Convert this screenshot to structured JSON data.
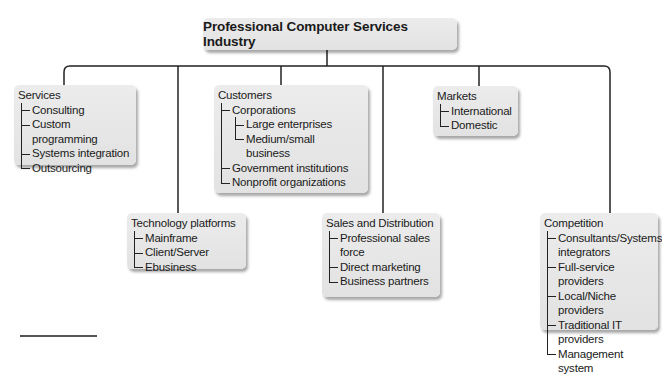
{
  "diagram": {
    "title": "Professional Computer Services Industry",
    "colors": {
      "box_fill": "#e6e6e6",
      "line": "#222222",
      "text": "#1a1a1a"
    },
    "categories": [
      {
        "id": "services",
        "title": "Services",
        "items": [
          {
            "label": "Consulting"
          },
          {
            "label": "Custom programming"
          },
          {
            "label": "Systems integration"
          },
          {
            "label": "Outsourcing"
          }
        ]
      },
      {
        "id": "technology-platforms",
        "title": "Technology platforms",
        "items": [
          {
            "label": "Mainframe"
          },
          {
            "label": "Client/Server"
          },
          {
            "label": "Ebusiness"
          }
        ]
      },
      {
        "id": "customers",
        "title": "Customers",
        "items": [
          {
            "label": "Corporations",
            "children": [
              {
                "label": "Large enterprises"
              },
              {
                "label": "Medium/small business"
              }
            ]
          },
          {
            "label": "Government institutions"
          },
          {
            "label": "Nonprofit organizations"
          }
        ]
      },
      {
        "id": "sales-and-distribution",
        "title": "Sales and Distribution",
        "items": [
          {
            "label": "Professional sales force"
          },
          {
            "label": "Direct marketing"
          },
          {
            "label": "Business partners"
          }
        ]
      },
      {
        "id": "markets",
        "title": "Markets",
        "items": [
          {
            "label": "International"
          },
          {
            "label": "Domestic"
          }
        ]
      },
      {
        "id": "competition",
        "title": "Competition",
        "items": [
          {
            "label": "Consultants/Systems integrators"
          },
          {
            "label": "Full-service providers"
          },
          {
            "label": "Local/Niche providers"
          },
          {
            "label": "Traditional IT providers"
          },
          {
            "label": "Management system"
          }
        ]
      }
    ]
  }
}
